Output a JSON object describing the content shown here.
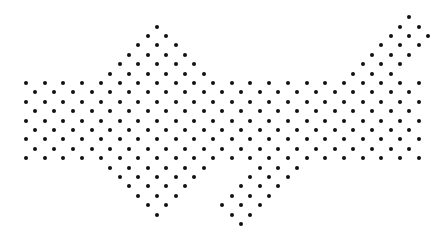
{
  "figure": {
    "dot_color": "#111111",
    "background": "#ffffff",
    "dot_size": 4,
    "lattice": {
      "origin_x": 26,
      "origin_y": 83,
      "dx": 9.35,
      "dy": 9.4
    },
    "rows": [
      {
        "j": -7,
        "ranges": [
          [
            41,
            41
          ]
        ]
      },
      {
        "j": -6,
        "ranges": [
          [
            14,
            14
          ],
          [
            40,
            42
          ]
        ]
      },
      {
        "j": -5,
        "ranges": [
          [
            13,
            15
          ],
          [
            39,
            43
          ]
        ]
      },
      {
        "j": -4,
        "ranges": [
          [
            12,
            16
          ],
          [
            38,
            42
          ]
        ]
      },
      {
        "j": -3,
        "ranges": [
          [
            11,
            17
          ],
          [
            37,
            41
          ]
        ]
      },
      {
        "j": -2,
        "ranges": [
          [
            10,
            18
          ],
          [
            36,
            40
          ]
        ]
      },
      {
        "j": -1,
        "ranges": [
          [
            9,
            19
          ],
          [
            35,
            39
          ]
        ]
      },
      {
        "j": 0,
        "ranges": [
          [
            0,
            42
          ]
        ]
      },
      {
        "j": 1,
        "ranges": [
          [
            1,
            41
          ]
        ]
      },
      {
        "j": 2,
        "ranges": [
          [
            0,
            42
          ]
        ]
      },
      {
        "j": 3,
        "ranges": [
          [
            1,
            41
          ]
        ]
      },
      {
        "j": 4,
        "ranges": [
          [
            0,
            42
          ]
        ]
      },
      {
        "j": 5,
        "ranges": [
          [
            1,
            41
          ]
        ]
      },
      {
        "j": 6,
        "ranges": [
          [
            0,
            42
          ]
        ]
      },
      {
        "j": 7,
        "ranges": [
          [
            1,
            41
          ]
        ]
      },
      {
        "j": 8,
        "ranges": [
          [
            0,
            42
          ]
        ]
      },
      {
        "j": 9,
        "ranges": [
          [
            9,
            19
          ],
          [
            25,
            29
          ]
        ]
      },
      {
        "j": 10,
        "ranges": [
          [
            10,
            18
          ],
          [
            24,
            28
          ]
        ]
      },
      {
        "j": 11,
        "ranges": [
          [
            11,
            17
          ],
          [
            23,
            27
          ]
        ]
      },
      {
        "j": 12,
        "ranges": [
          [
            12,
            16
          ],
          [
            22,
            26
          ]
        ]
      },
      {
        "j": 13,
        "ranges": [
          [
            13,
            15
          ],
          [
            21,
            25
          ]
        ]
      },
      {
        "j": 14,
        "ranges": [
          [
            14,
            14
          ],
          [
            22,
            24
          ]
        ]
      },
      {
        "j": 15,
        "ranges": [
          [
            23,
            23
          ]
        ]
      }
    ]
  }
}
